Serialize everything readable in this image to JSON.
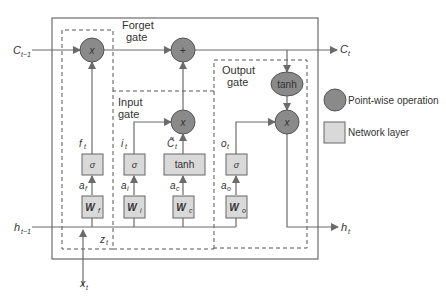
{
  "gates": {
    "forget": {
      "line1": "Forget",
      "line2": "gate"
    },
    "input": {
      "line1": "Input",
      "line2": "gate"
    },
    "output": {
      "line1": "Output",
      "line2": "gate"
    }
  },
  "inputs": {
    "c_prev": {
      "base": "C",
      "sub": "t−1"
    },
    "h_prev": {
      "base": "h",
      "sub": "t−1"
    },
    "x_t": {
      "base": "x",
      "sub": "t"
    }
  },
  "outputs": {
    "c_t": {
      "base": "C",
      "sub": "t"
    },
    "h_t": {
      "base": "h",
      "sub": "t"
    }
  },
  "pointwise_ops": {
    "forget_mult": "x",
    "cell_add": "+",
    "input_mult": "x",
    "output_mult": "x",
    "output_tanh": "tanh"
  },
  "layers": {
    "sigma_f": "σ",
    "sigma_i": "σ",
    "tanh_c": "tanh",
    "sigma_o": "σ",
    "w_f": {
      "base": "W",
      "sub": "f"
    },
    "w_i": {
      "base": "W",
      "sub": "i"
    },
    "w_c": {
      "base": "W",
      "sub": "c"
    },
    "w_o": {
      "base": "W",
      "sub": "o"
    }
  },
  "signals": {
    "f_t": {
      "base": "f",
      "sub": "t"
    },
    "i_t": {
      "base": "i",
      "sub": "t"
    },
    "c_tilde": {
      "base": "C̃",
      "sub": "t"
    },
    "o_t": {
      "base": "o",
      "sub": "t"
    },
    "a_f": {
      "base": "a",
      "sub": "f"
    },
    "a_i": {
      "base": "a",
      "sub": "i"
    },
    "a_c": {
      "base": "a",
      "sub": "c"
    },
    "a_o": {
      "base": "a",
      "sub": "o"
    },
    "z_t": {
      "base": "z",
      "sub": "t"
    }
  },
  "legend": {
    "pointwise": "Point-wise operation",
    "network_layer": "Network layer"
  },
  "colors": {
    "line": "#6b6b6b",
    "pointwise_fill": "#8a8a8a",
    "layer_fill": "#d9d9d9",
    "text": "#333333"
  }
}
